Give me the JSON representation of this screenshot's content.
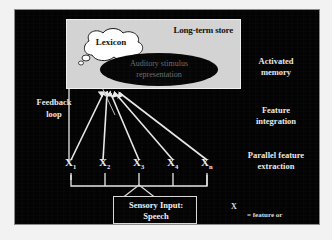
{
  "figure": {
    "background_color": "#030303",
    "panel_color": "#d3d3d3",
    "line_color": "#e8e8e8",
    "text_color": "#e8e8e8"
  },
  "long_term_store": {
    "title": "Long-term store",
    "lexicon_label": "Lexicon",
    "ellipse_label": "Auditory stimulus\nrepresentation",
    "ellipse_label_line1": "Auditory stimulus",
    "ellipse_label_line2": "representation"
  },
  "stage_labels": {
    "activated_memory": "Activated\nmemory",
    "activated_memory_line1": "Activated",
    "activated_memory_line2": "memory",
    "feature_integration": "Feature\nintegration",
    "feature_integration_line1": "Feature",
    "feature_integration_line2": "integration",
    "parallel_feature_extraction": "Parallel feature\nextraction",
    "parallel_feature_extraction_line1": "Parallel feature",
    "parallel_feature_extraction_line2": "extraction",
    "feedback_loop": "Feedback\nloop",
    "feedback_loop_line1": "Feedback",
    "feedback_loop_line2": "loop"
  },
  "nodes": [
    {
      "base": "X",
      "sub": "1"
    },
    {
      "base": "X",
      "sub": "2"
    },
    {
      "base": "X",
      "sub": "3"
    },
    {
      "base": "X",
      "sub": "4"
    },
    {
      "base": "X",
      "sub": "n"
    }
  ],
  "sensory_input": {
    "line1": "Sensory Input:",
    "line2": "Speech"
  },
  "legend": {
    "symbol": "X",
    "text": "= feature or\n   feature combinations",
    "line1": "= feature or",
    "line2": "feature combinations"
  }
}
